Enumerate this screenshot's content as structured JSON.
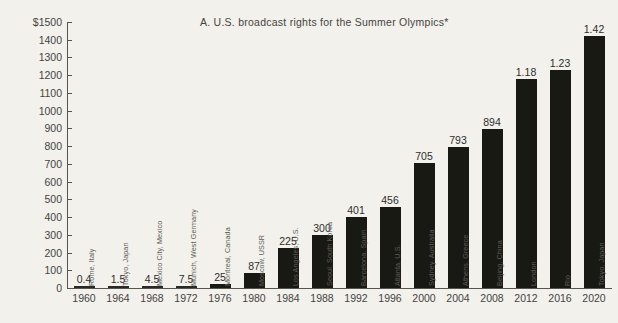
{
  "chart_data": {
    "type": "bar",
    "title": "A.  U.S. broadcast rights for the Summer Olympics*",
    "xlabel": "",
    "ylabel": "",
    "ylim": [
      0,
      1500
    ],
    "ytick_labels": [
      "$1500",
      "1400",
      "1300",
      "1200",
      "1100",
      "1000",
      "900",
      "800",
      "700",
      "600",
      "500",
      "400",
      "300",
      "200",
      "100",
      "0"
    ],
    "ytick_values": [
      1500,
      1400,
      1300,
      1200,
      1100,
      1000,
      900,
      800,
      700,
      600,
      500,
      400,
      300,
      200,
      100,
      0
    ],
    "grid": false,
    "legend": "none",
    "categories": [
      "1960",
      "1964",
      "1968",
      "1972",
      "1976",
      "1980",
      "1984",
      "1988",
      "1992",
      "1996",
      "2000",
      "2004",
      "2008",
      "2012",
      "2016",
      "2020"
    ],
    "values": [
      0.4,
      1.5,
      4.5,
      7.5,
      25,
      87,
      225,
      300,
      401,
      456,
      705,
      793,
      894,
      1180,
      1230,
      1420
    ],
    "value_labels": [
      "0.4",
      "1.5",
      "4.5",
      "7.5",
      "25",
      "87",
      "225",
      "300",
      "401",
      "456",
      "705",
      "793",
      "894",
      "1.18",
      "1.23",
      "1.42"
    ],
    "point_labels": [
      "Rome, Italy",
      "Tokyo, Japan",
      "Mexico City, Mexico",
      "Munich, West Germany",
      "Montreal, Canada",
      "Moscow, USSR",
      "Los Angeles, U.S.",
      "Seoul, South Korea",
      "Barcelona, Spain",
      "Atlanta, U.S.",
      "Sydney, Australia",
      "Athens, Greece",
      "Beijing, China",
      "London",
      "Rio",
      "Tokyo, Japan"
    ],
    "bar_color": "#191914",
    "axis_color": "#55544f",
    "background": "#f2f1ec"
  }
}
